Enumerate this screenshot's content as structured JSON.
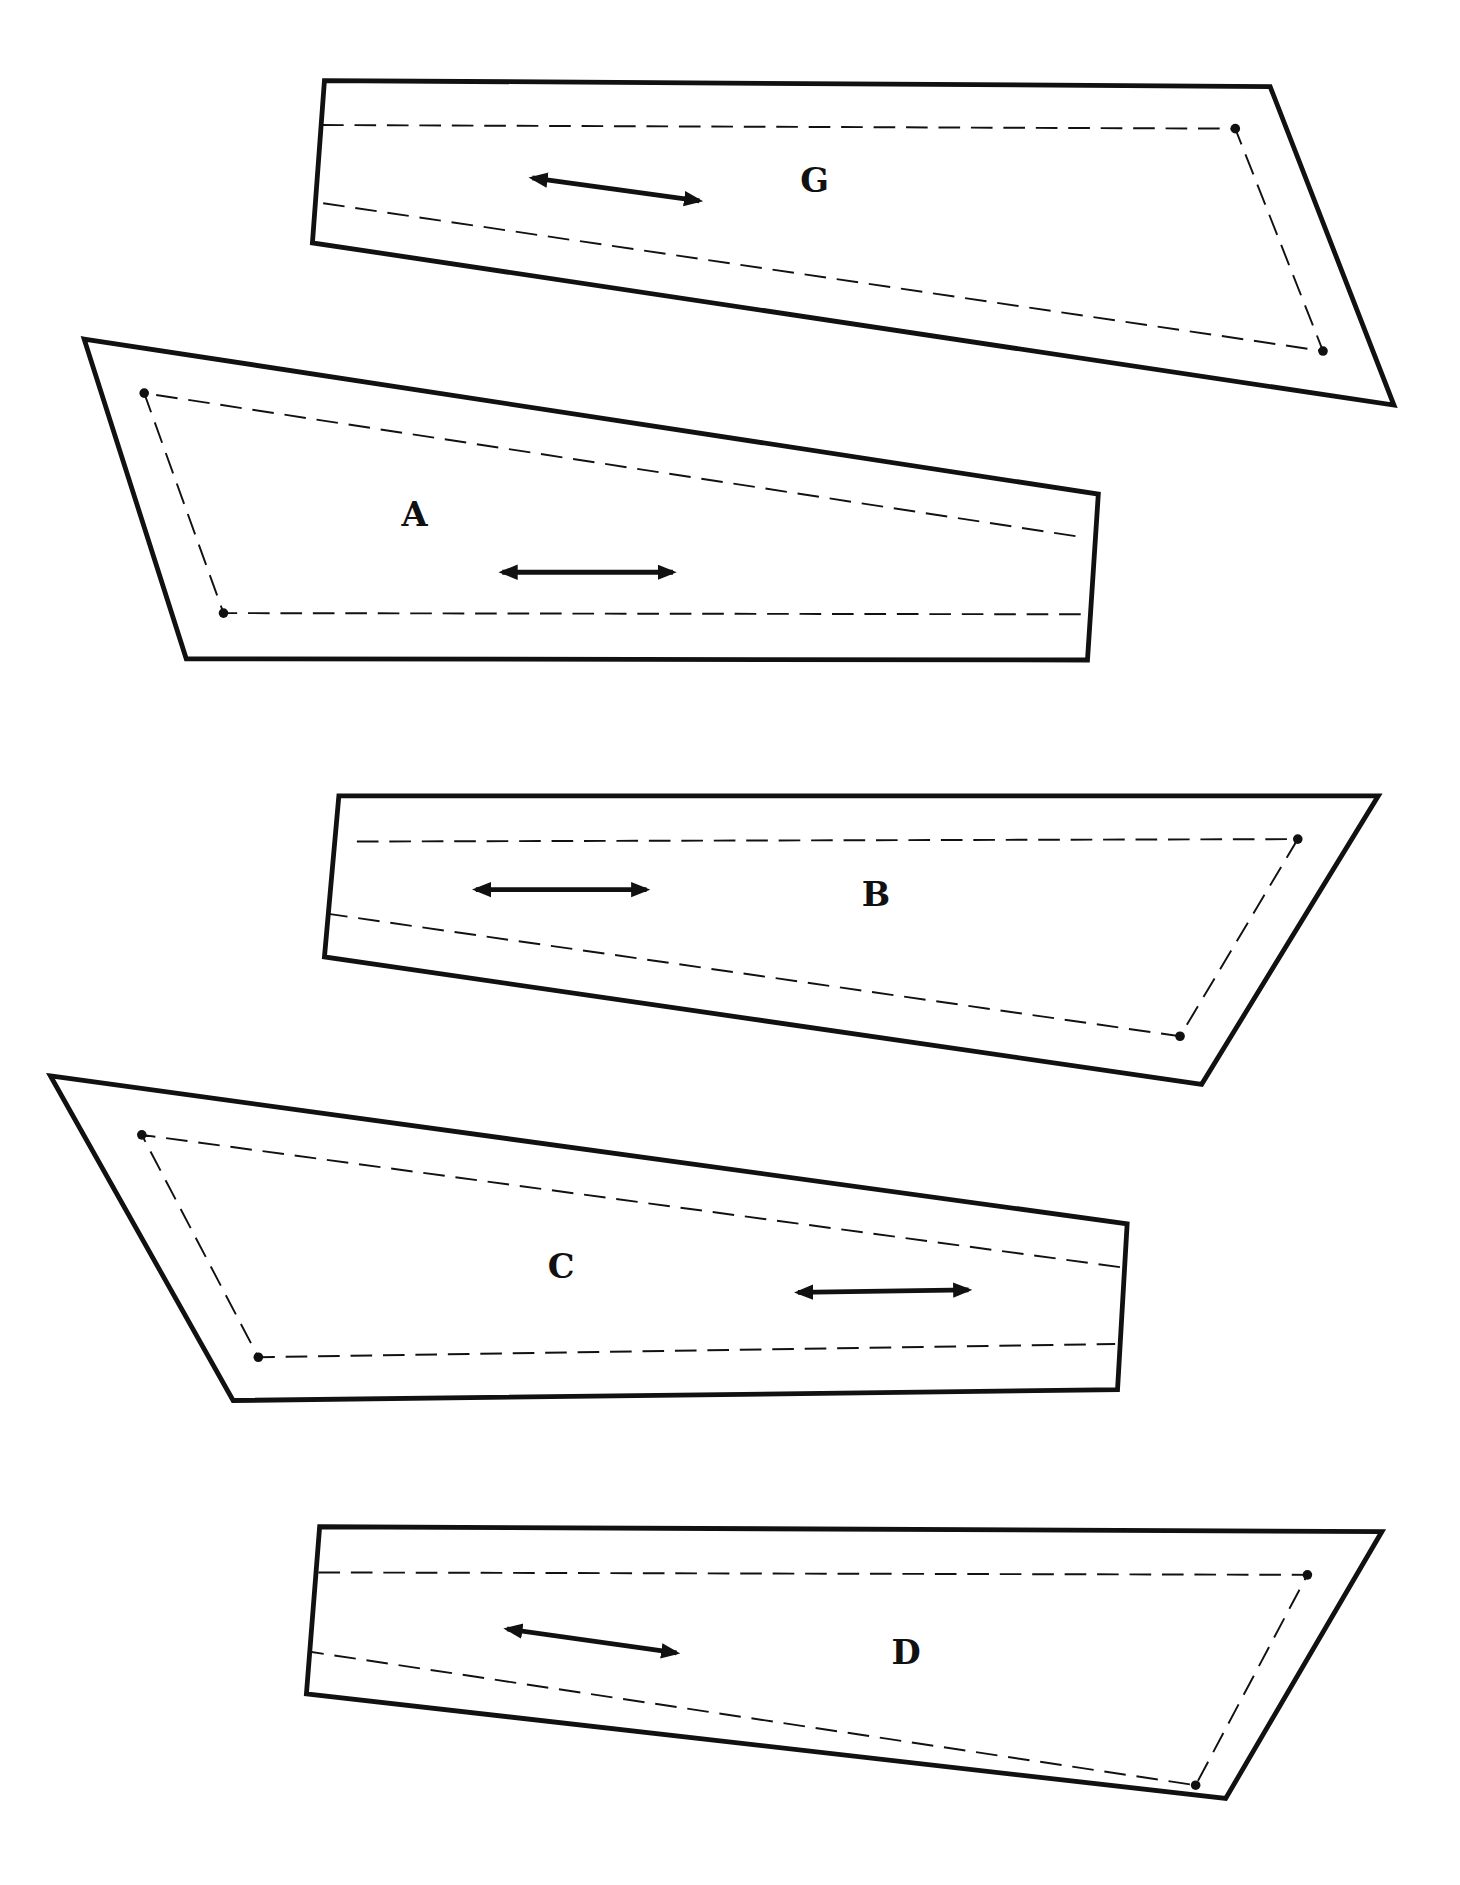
{
  "diagram": {
    "type": "sewing-pattern-pieces",
    "pieces": [
      {
        "label": "G",
        "outline": [
          [
            270,
            67
          ],
          [
            1057,
            72
          ],
          [
            1160,
            337
          ],
          [
            260,
            202
          ]
        ],
        "seam": [
          [
            268,
            104
          ],
          [
            1028,
            107
          ],
          [
            1101,
            292
          ],
          [
            262,
            168
          ]
        ],
        "dots": [
          [
            1028,
            107
          ],
          [
            1101,
            292
          ]
        ],
        "grain": [
          [
            443,
            148
          ],
          [
            582,
            167
          ]
        ],
        "label_pos": [
          678,
          152
        ]
      },
      {
        "label": "A",
        "outline": [
          [
            70,
            282
          ],
          [
            914,
            411
          ],
          [
            905,
            549
          ],
          [
            155,
            548
          ]
        ],
        "seam": [
          [
            895,
            446
          ],
          [
            120,
            327
          ],
          [
            186,
            510
          ],
          [
            905,
            511
          ]
        ],
        "dots": [
          [
            120,
            327
          ],
          [
            186,
            510
          ]
        ],
        "grain": [
          [
            418,
            476
          ],
          [
            560,
            476
          ]
        ],
        "label_pos": [
          345,
          430
        ]
      },
      {
        "label": "B",
        "outline": [
          [
            282,
            662
          ],
          [
            1147,
            662
          ],
          [
            1000,
            902
          ],
          [
            270,
            796
          ]
        ],
        "seam": [
          [
            297,
            700
          ],
          [
            1080,
            698
          ],
          [
            982,
            862
          ],
          [
            272,
            760
          ]
        ],
        "dots": [
          [
            1080,
            698
          ],
          [
            982,
            862
          ]
        ],
        "grain": [
          [
            396,
            740
          ],
          [
            538,
            740
          ]
        ],
        "label_pos": [
          729,
          746
        ]
      },
      {
        "label": "C",
        "outline": [
          [
            42,
            895
          ],
          [
            938,
            1018
          ],
          [
            930,
            1156
          ],
          [
            194,
            1165
          ]
        ],
        "seam": [
          [
            932,
            1054
          ],
          [
            118,
            944
          ],
          [
            215,
            1129
          ],
          [
            928,
            1118
          ]
        ],
        "dots": [
          [
            118,
            944
          ],
          [
            215,
            1129
          ]
        ],
        "grain": [
          [
            664,
            1075
          ],
          [
            806,
            1073
          ]
        ],
        "label_pos": [
          467,
          1056
        ]
      },
      {
        "label": "D",
        "outline": [
          [
            266,
            1270
          ],
          [
            1150,
            1274
          ],
          [
            1020,
            1496
          ],
          [
            255,
            1409
          ]
        ],
        "seam": [
          [
            265,
            1308
          ],
          [
            1088,
            1310
          ],
          [
            995,
            1485
          ],
          [
            258,
            1374
          ]
        ],
        "dots": [
          [
            1088,
            1310
          ],
          [
            995,
            1485
          ]
        ],
        "grain": [
          [
            422,
            1355
          ],
          [
            563,
            1375
          ]
        ],
        "label_pos": [
          754,
          1377
        ]
      }
    ]
  }
}
